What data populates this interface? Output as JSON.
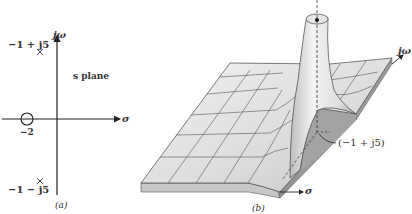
{
  "figure_a": {
    "caption": "(a)",
    "plane_label": "s plane",
    "vertical_axis_label": "jω",
    "horizontal_axis_label": "σ",
    "pole_upper_label": "−1 + j5",
    "pole_lower_label": "−1 − j5",
    "zero_label": "−2",
    "poles": [
      {
        "re": -1,
        "im": 5,
        "marker": "x"
      },
      {
        "re": -1,
        "im": -5,
        "marker": "x"
      }
    ],
    "zeros": [
      {
        "re": -2,
        "im": 0,
        "marker": "o"
      }
    ]
  },
  "figure_b": {
    "caption": "(b)",
    "vertical_axis_label": "jω",
    "horizontal_axis_label": "σ",
    "pole_annotation": "(−1 + j5)",
    "colors": {
      "surface_light": "#e8e8e8",
      "surface_mid": "#cfcfcf",
      "surface_dark": "#9a9a9a",
      "grid_line": "#444444"
    }
  }
}
